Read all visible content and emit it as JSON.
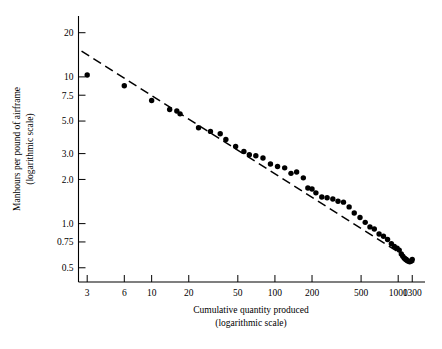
{
  "chart_data": {
    "type": "scatter",
    "title": "",
    "xlabel": "Cumulative quantity produced",
    "xlabel_sub": "(logarithmic scale)",
    "ylabel": "Manhours per pound of airframe",
    "ylabel_sub": "(logarithmic scale)",
    "xscale": "log",
    "yscale": "log",
    "xlim": [
      2.55,
      1650
    ],
    "ylim": [
      0.4,
      26.0
    ],
    "grid": false,
    "legend": null,
    "xticks": [
      3,
      6,
      10,
      20,
      50,
      100,
      200,
      500,
      1000,
      1300
    ],
    "xticklabels": [
      "3",
      "6",
      "10",
      "20",
      "50",
      "100",
      "200",
      "500",
      "1000",
      "1300"
    ],
    "yticks": [
      20,
      10,
      7.5,
      5.0,
      3.0,
      2.0,
      1.0,
      0.75,
      0.5
    ],
    "yticklabels": [
      "20",
      "10",
      "7.5",
      "5.0",
      "3.0",
      "2.0",
      "1.0",
      "0.75",
      "0.5"
    ],
    "series": [
      {
        "name": "Observed unit manhours",
        "marker": "filled-circle",
        "color": "#000000",
        "points": [
          [
            3,
            10.3
          ],
          [
            6,
            8.7
          ],
          [
            10,
            6.9
          ],
          [
            14,
            6.0
          ],
          [
            16,
            5.85
          ],
          [
            17,
            5.6
          ],
          [
            24,
            4.5
          ],
          [
            30,
            4.25
          ],
          [
            36,
            4.1
          ],
          [
            40,
            3.75
          ],
          [
            48,
            3.35
          ],
          [
            56,
            3.1
          ],
          [
            62,
            2.95
          ],
          [
            70,
            2.9
          ],
          [
            80,
            2.8
          ],
          [
            92,
            2.55
          ],
          [
            105,
            2.45
          ],
          [
            120,
            2.4
          ],
          [
            135,
            2.2
          ],
          [
            150,
            2.25
          ],
          [
            170,
            2.05
          ],
          [
            185,
            1.75
          ],
          [
            200,
            1.72
          ],
          [
            215,
            1.62
          ],
          [
            240,
            1.52
          ],
          [
            265,
            1.5
          ],
          [
            295,
            1.47
          ],
          [
            325,
            1.42
          ],
          [
            360,
            1.4
          ],
          [
            400,
            1.3
          ],
          [
            440,
            1.18
          ],
          [
            490,
            1.1
          ],
          [
            540,
            1.02
          ],
          [
            590,
            0.95
          ],
          [
            640,
            0.92
          ],
          [
            700,
            0.85
          ],
          [
            760,
            0.82
          ],
          [
            820,
            0.78
          ],
          [
            880,
            0.73
          ],
          [
            930,
            0.7
          ],
          [
            980,
            0.68
          ],
          [
            1020,
            0.66
          ],
          [
            1060,
            0.62
          ],
          [
            1090,
            0.6
          ],
          [
            1120,
            0.58
          ],
          [
            1150,
            0.57
          ],
          [
            1180,
            0.56
          ],
          [
            1210,
            0.555
          ],
          [
            1240,
            0.55
          ],
          [
            1270,
            0.555
          ],
          [
            1300,
            0.57
          ]
        ]
      }
    ],
    "trendline": {
      "name": "Fitted learning curve",
      "style": "dashed",
      "color": "#000000",
      "start": [
        2.7,
        15.0
      ],
      "end": [
        1350,
        0.545
      ]
    }
  },
  "axis": {
    "x_title": "Cumulative quantity produced",
    "x_subtitle": "(logarithmic scale)",
    "y_title": "Manhours per pound of airframe",
    "y_subtitle": "(logarithmic scale)"
  }
}
